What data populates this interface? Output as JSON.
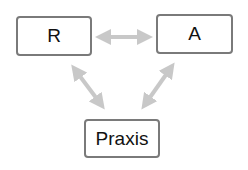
{
  "diagram": {
    "nodes": [
      {
        "id": "R",
        "label": "R"
      },
      {
        "id": "A",
        "label": "A"
      },
      {
        "id": "Praxis",
        "label": "Praxis"
      }
    ],
    "edges": [
      {
        "from": "R",
        "to": "A",
        "type": "bidirectional"
      },
      {
        "from": "R",
        "to": "Praxis",
        "type": "bidirectional"
      },
      {
        "from": "A",
        "to": "Praxis",
        "type": "bidirectional"
      }
    ],
    "colors": {
      "box_border": "#7a7a7a",
      "arrow": "#c8c8c8",
      "text": "#111111"
    }
  }
}
